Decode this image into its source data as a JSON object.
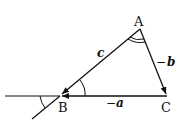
{
  "diagram": {
    "type": "triangle-vector-diagram",
    "vertices": {
      "A": {
        "label": "A",
        "x": 140,
        "y": 29
      },
      "B": {
        "label": "B",
        "x": 60,
        "y": 96
      },
      "C": {
        "label": "C",
        "x": 167,
        "y": 96
      }
    },
    "edges": [
      {
        "from": "A",
        "to": "B",
        "label": "c",
        "prefix": ""
      },
      {
        "from": "A",
        "to": "C",
        "label": "b",
        "prefix": "−"
      },
      {
        "from": "C",
        "to": "B",
        "label": "a",
        "prefix": "−"
      }
    ],
    "labels": {
      "A": "A",
      "B": "B",
      "C": "C",
      "c": "c",
      "b_minus": "−",
      "b": "b",
      "a_minus": "−",
      "a": "a"
    },
    "angle_marks": [
      {
        "at": "A",
        "type": "double-arc"
      },
      {
        "at": "B",
        "type": "single-arc-interior"
      },
      {
        "at": "B",
        "type": "single-arc-exterior"
      }
    ],
    "colors": {
      "stroke": "#111111",
      "background": "#ffffff"
    }
  }
}
